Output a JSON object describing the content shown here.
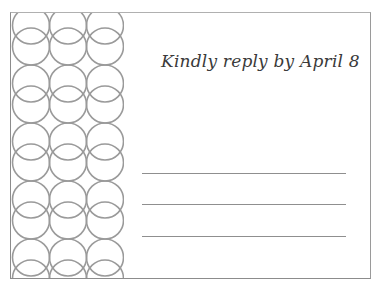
{
  "card": {
    "message": "Kindly reply by April 8",
    "reply_lines": [
      {
        "top": 160
      },
      {
        "top": 191
      },
      {
        "top": 223
      }
    ]
  },
  "colors": {
    "border": "#8c8c8c",
    "circle_stroke": "#9a9a9a",
    "text": "#3a3a3a",
    "rule": "#8f8f8f"
  }
}
